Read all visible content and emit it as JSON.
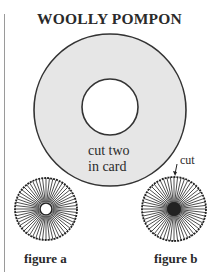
{
  "title": "WOOLLY POMPON",
  "card": {
    "line1": "cut two",
    "line2": "in card",
    "fill": "#e6e6e6",
    "stroke": "#333333"
  },
  "cut_label": "cut",
  "figures": [
    {
      "label": "figure a"
    },
    {
      "label": "figure b"
    }
  ]
}
